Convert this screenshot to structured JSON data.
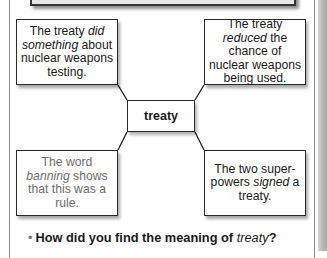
{
  "concept_map": {
    "center": {
      "label": "treaty"
    },
    "notes": [
      {
        "position": "top-left",
        "before": "The treaty ",
        "emphasis": "did something",
        "after": " about nuclear weapons testing.",
        "style": "dark"
      },
      {
        "position": "top-right",
        "before": "The treaty ",
        "emphasis": "reduced",
        "after": " the chance of nuclear weapons being used.",
        "style": "dark"
      },
      {
        "position": "bottom-left",
        "before": "The word ",
        "emphasis": "banning",
        "after": " shows that this was a rule.",
        "style": "faded"
      },
      {
        "position": "bottom-right",
        "before": "The two super-powers ",
        "emphasis": "signed",
        "after": " a treaty.",
        "style": "dark"
      }
    ]
  },
  "question": {
    "bullet": "•",
    "before": "How did you find the meaning of ",
    "emphasis": "treaty",
    "after": "?"
  },
  "colors": {
    "border": "#2a2a2a",
    "faded_text": "#6e6e6e",
    "banner_fill": "#e6e6e6"
  }
}
